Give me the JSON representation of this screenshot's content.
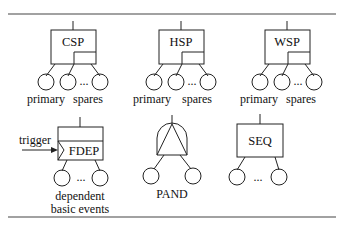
{
  "figure": {
    "top_rule": true,
    "bottom_rule": true
  },
  "gates": {
    "csp": {
      "label": "CSP",
      "primary_label": "primary",
      "spares_label": "spares",
      "ellipsis": "..."
    },
    "hsp": {
      "label": "HSP",
      "primary_label": "primary",
      "spares_label": "spares",
      "ellipsis": "..."
    },
    "wsp": {
      "label": "WSP",
      "primary_label": "primary",
      "spares_label": "spares",
      "ellipsis": "..."
    },
    "fdep": {
      "label": "FDEP",
      "trigger_label": "trigger",
      "caption_line1": "dependent",
      "caption_line2": "basic events",
      "ellipsis": "..."
    },
    "pand": {
      "label": "PAND"
    },
    "seq": {
      "label": "SEQ",
      "ellipsis": "..."
    }
  },
  "colors": {
    "stroke": "#222222",
    "background": "#ffffff"
  }
}
